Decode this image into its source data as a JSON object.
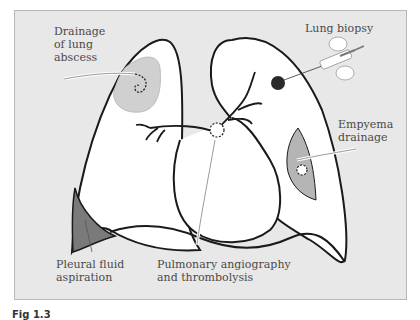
{
  "figure": {
    "labels": {
      "abscess": "Drainage\nof lung\nabscess",
      "biopsy": "Lung biopsy",
      "empyema": "Empyema\ndrainage",
      "pleural": "Pleural fluid\naspiration",
      "pulmonary": "Pulmonary angiography\nand thrombolysis"
    },
    "caption": "Fig 1.3",
    "colors": {
      "panel_bg": "#e8e8e8",
      "lung_fill": "#ffffff",
      "outline": "#1a1a1a",
      "abscess_fill": "#d0d0d0",
      "empyema_fill": "#b5b5b5",
      "pleural_fill": "#7a7a7a",
      "lesion_fill": "#2a2a2a",
      "label_text": "#4a4a4a"
    }
  }
}
